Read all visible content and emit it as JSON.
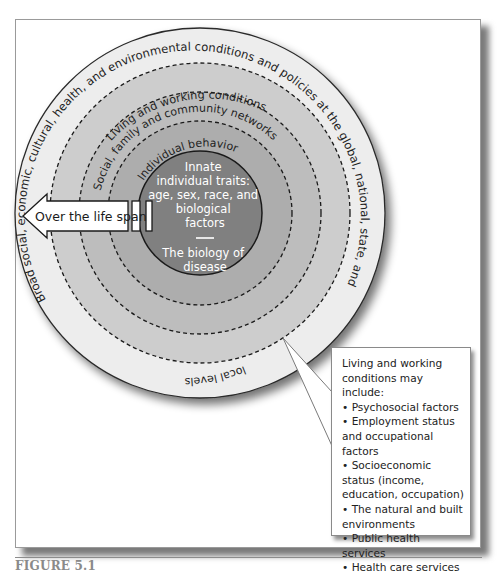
{
  "figure": {
    "caption": "FIGURE 5.1"
  },
  "rings": {
    "outer": {
      "label_main": "Broad social, economic, cultural, health, and environmental conditions and policies at the global, national, state, and",
      "label_bottom": "local levels",
      "color": "#ececec"
    },
    "living_working": {
      "label": "Living and working conditions",
      "color": "#c9c9c9"
    },
    "social_community": {
      "label": "Social, family and community networks",
      "color": "#b8b8b8"
    },
    "individual_behavior": {
      "label": "Individual behavior",
      "color": "#a9a9a9"
    },
    "core": {
      "lines_top": [
        "Innate",
        "individual traits:",
        "age, sex, race, and",
        "biological",
        "factors"
      ],
      "separator": "—",
      "lines_bottom": [
        "The biology of",
        "disease"
      ],
      "color": "#7f7f7f"
    }
  },
  "arrow": {
    "label": "Over the life span"
  },
  "callout": {
    "heading": "Living and working conditions may include:",
    "items": [
      "Psychosocial factors",
      "Employment status and occupational factors",
      "Socioeconomic status (income, education, occupation)",
      "The natural and built environments",
      "Public health services",
      "Health care services"
    ]
  }
}
